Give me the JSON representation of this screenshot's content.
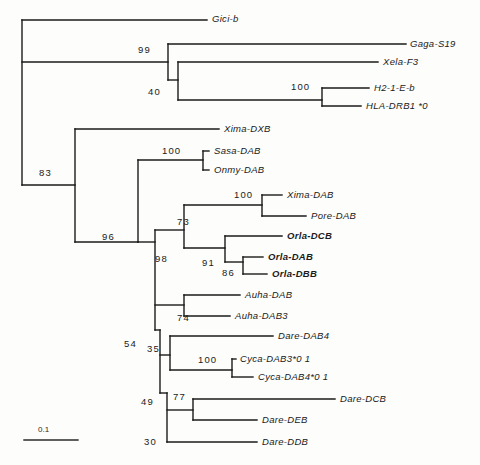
{
  "figure": {
    "type": "phylogenetic-tree",
    "background_color": "#fdfdfc",
    "line_color": "#1a1a1a",
    "text_color": "#1a1a1a"
  },
  "scale_bar": {
    "label": "0.1",
    "x1": 24,
    "x2": 78,
    "y": 440,
    "label_x": 38,
    "label_y": 425
  },
  "taxa": [
    {
      "id": "gici-b",
      "label": "Gici-b",
      "x": 212,
      "y": 14,
      "bold": false,
      "tip_x": 207,
      "tip_y": 20
    },
    {
      "id": "gaga-s19",
      "label": "Gaga-S19",
      "x": 410,
      "y": 39,
      "bold": false,
      "tip_x": 406,
      "tip_y": 44
    },
    {
      "id": "xela-f3",
      "label": "Xela-F3",
      "x": 383,
      "y": 57,
      "bold": false,
      "tip_x": 378,
      "tip_y": 62
    },
    {
      "id": "h2-1-e-b",
      "label": "H2-1-E-b",
      "x": 374,
      "y": 83,
      "bold": false,
      "tip_x": 369,
      "tip_y": 88
    },
    {
      "id": "hla-drb1-0",
      "label": "HLA-DRB1 *0",
      "x": 366,
      "y": 101,
      "bold": false,
      "tip_x": 361,
      "tip_y": 106
    },
    {
      "id": "xima-dxb",
      "label": "Xima-DXB",
      "x": 224,
      "y": 124,
      "bold": false,
      "tip_x": 219,
      "tip_y": 129
    },
    {
      "id": "sasa-dab",
      "label": "Sasa-DAB",
      "x": 214,
      "y": 146,
      "bold": false,
      "tip_x": 209,
      "tip_y": 151
    },
    {
      "id": "onmy-dab",
      "label": "Onmy-DAB",
      "x": 214,
      "y": 165,
      "bold": false,
      "tip_x": 209,
      "tip_y": 170
    },
    {
      "id": "xima-dab",
      "label": "Xima-DAB",
      "x": 287,
      "y": 190,
      "bold": false,
      "tip_x": 282,
      "tip_y": 195
    },
    {
      "id": "pore-dab",
      "label": "Pore-DAB",
      "x": 311,
      "y": 211,
      "bold": false,
      "tip_x": 306,
      "tip_y": 216
    },
    {
      "id": "orla-dcb",
      "label": "Orla-DCB",
      "x": 287,
      "y": 231,
      "bold": true,
      "tip_x": 282,
      "tip_y": 236
    },
    {
      "id": "orla-dab",
      "label": "Orla-DAB",
      "x": 268,
      "y": 252,
      "bold": true,
      "tip_x": 263,
      "tip_y": 257
    },
    {
      "id": "orla-dbb",
      "label": "Orla-DBB",
      "x": 272,
      "y": 269,
      "bold": true,
      "tip_x": 267,
      "tip_y": 274
    },
    {
      "id": "auha-dab",
      "label": "Auha-DAB",
      "x": 245,
      "y": 290,
      "bold": false,
      "tip_x": 240,
      "tip_y": 295
    },
    {
      "id": "auha-dab3",
      "label": "Auha-DAB3",
      "x": 235,
      "y": 311,
      "bold": false,
      "tip_x": 230,
      "tip_y": 316
    },
    {
      "id": "dare-dab4",
      "label": "Dare-DAB4",
      "x": 278,
      "y": 331,
      "bold": false,
      "tip_x": 273,
      "tip_y": 336
    },
    {
      "id": "cyca-dab3-01",
      "label": "Cyca-DAB3*0 1",
      "x": 240,
      "y": 354,
      "bold": false,
      "tip_x": 236,
      "tip_y": 359
    },
    {
      "id": "cyca-dab4-01",
      "label": "Cyca-DAB4*0 1",
      "x": 258,
      "y": 372,
      "bold": false,
      "tip_x": 253,
      "tip_y": 377
    },
    {
      "id": "dare-dcb",
      "label": "Dare-DCB",
      "x": 340,
      "y": 394,
      "bold": false,
      "tip_x": 335,
      "tip_y": 399
    },
    {
      "id": "dare-deb",
      "label": "Dare-DEB",
      "x": 262,
      "y": 415,
      "bold": false,
      "tip_x": 257,
      "tip_y": 420
    },
    {
      "id": "dare-ddb",
      "label": "Dare-DDB",
      "x": 262,
      "y": 437,
      "bold": false,
      "tip_x": 257,
      "tip_y": 442
    }
  ],
  "support_values": [
    {
      "id": "node-99",
      "label": "99",
      "x": 138,
      "y": 45
    },
    {
      "id": "node-40",
      "label": "40",
      "x": 148,
      "y": 87
    },
    {
      "id": "node-100a",
      "label": "100",
      "x": 291,
      "y": 82
    },
    {
      "id": "node-83",
      "label": "83",
      "x": 39,
      "y": 168
    },
    {
      "id": "node-100b",
      "label": "100",
      "x": 162,
      "y": 146
    },
    {
      "id": "node-100c",
      "label": "100",
      "x": 234,
      "y": 190
    },
    {
      "id": "node-73",
      "label": "73",
      "x": 177,
      "y": 217
    },
    {
      "id": "node-96",
      "label": "96",
      "x": 102,
      "y": 232
    },
    {
      "id": "node-98",
      "label": "98",
      "x": 155,
      "y": 254
    },
    {
      "id": "node-91",
      "label": "91",
      "x": 202,
      "y": 258
    },
    {
      "id": "node-86",
      "label": "86",
      "x": 222,
      "y": 268
    },
    {
      "id": "node-74",
      "label": "74",
      "x": 177,
      "y": 313
    },
    {
      "id": "node-54",
      "label": "54",
      "x": 124,
      "y": 339
    },
    {
      "id": "node-35",
      "label": "35",
      "x": 147,
      "y": 344
    },
    {
      "id": "node-100d",
      "label": "100",
      "x": 198,
      "y": 355
    },
    {
      "id": "node-49",
      "label": "49",
      "x": 141,
      "y": 397
    },
    {
      "id": "node-77",
      "label": "77",
      "x": 173,
      "y": 392
    },
    {
      "id": "node-30",
      "label": "30",
      "x": 144,
      "y": 437
    }
  ],
  "branches": [
    {
      "id": "root-vertical",
      "x1": 22,
      "y1": 20,
      "x2": 22,
      "y2": 185
    },
    {
      "id": "branch-gici-b",
      "x1": 22,
      "y1": 20,
      "x2": 207,
      "y2": 20
    },
    {
      "id": "branch-to-node99",
      "x1": 22,
      "y1": 62,
      "x2": 168,
      "y2": 62
    },
    {
      "id": "node99-vertical",
      "x1": 168,
      "y1": 44,
      "x2": 168,
      "y2": 80
    },
    {
      "id": "branch-gaga-s19",
      "x1": 168,
      "y1": 44,
      "x2": 406,
      "y2": 44
    },
    {
      "id": "node40-connector",
      "x1": 168,
      "y1": 80,
      "x2": 178,
      "y2": 80
    },
    {
      "id": "node40-vertical",
      "x1": 178,
      "y1": 62,
      "x2": 178,
      "y2": 100
    },
    {
      "id": "branch-xela-f3",
      "x1": 178,
      "y1": 62,
      "x2": 378,
      "y2": 62
    },
    {
      "id": "branch-to-node100a",
      "x1": 178,
      "y1": 100,
      "x2": 322,
      "y2": 100
    },
    {
      "id": "node100a-vertical",
      "x1": 322,
      "y1": 88,
      "x2": 322,
      "y2": 106
    },
    {
      "id": "branch-h2-1-e-b",
      "x1": 322,
      "y1": 88,
      "x2": 369,
      "y2": 88
    },
    {
      "id": "branch-hla-drb1",
      "x1": 322,
      "y1": 106,
      "x2": 361,
      "y2": 106
    },
    {
      "id": "branch-to-node83",
      "x1": 22,
      "y1": 185,
      "x2": 75,
      "y2": 185
    },
    {
      "id": "node83-vertical",
      "x1": 75,
      "y1": 129,
      "x2": 75,
      "y2": 242
    },
    {
      "id": "branch-xima-dxb",
      "x1": 75,
      "y1": 129,
      "x2": 219,
      "y2": 129
    },
    {
      "id": "branch-to-node96",
      "x1": 75,
      "y1": 242,
      "x2": 138,
      "y2": 242
    },
    {
      "id": "node96-vertical",
      "x1": 138,
      "y1": 160,
      "x2": 138,
      "y2": 242
    },
    {
      "id": "branch-to-node100b",
      "x1": 138,
      "y1": 160,
      "x2": 203,
      "y2": 160
    },
    {
      "id": "node100b-vertical",
      "x1": 203,
      "y1": 151,
      "x2": 203,
      "y2": 170
    },
    {
      "id": "branch-sasa-dab",
      "x1": 203,
      "y1": 151,
      "x2": 209,
      "y2": 151
    },
    {
      "id": "branch-onmy-dab",
      "x1": 203,
      "y1": 170,
      "x2": 209,
      "y2": 170
    },
    {
      "id": "branch-to-node98",
      "x1": 138,
      "y1": 242,
      "x2": 155,
      "y2": 242
    },
    {
      "id": "node98-vertical",
      "x1": 155,
      "y1": 230,
      "x2": 155,
      "y2": 330
    },
    {
      "id": "branch-to-node73",
      "x1": 155,
      "y1": 230,
      "x2": 184,
      "y2": 230
    },
    {
      "id": "node73-vertical",
      "x1": 184,
      "y1": 205,
      "x2": 184,
      "y2": 248
    },
    {
      "id": "branch-to-node100c",
      "x1": 184,
      "y1": 205,
      "x2": 262,
      "y2": 205
    },
    {
      "id": "node100c-vertical",
      "x1": 262,
      "y1": 195,
      "x2": 262,
      "y2": 216
    },
    {
      "id": "branch-xima-dab",
      "x1": 262,
      "y1": 195,
      "x2": 282,
      "y2": 195
    },
    {
      "id": "branch-pore-dab",
      "x1": 262,
      "y1": 216,
      "x2": 306,
      "y2": 216
    },
    {
      "id": "branch-to-node91",
      "x1": 184,
      "y1": 248,
      "x2": 225,
      "y2": 248
    },
    {
      "id": "node91-vertical",
      "x1": 225,
      "y1": 236,
      "x2": 225,
      "y2": 262
    },
    {
      "id": "branch-orla-dcb",
      "x1": 225,
      "y1": 236,
      "x2": 282,
      "y2": 236
    },
    {
      "id": "branch-to-node86",
      "x1": 225,
      "y1": 262,
      "x2": 243,
      "y2": 262
    },
    {
      "id": "node86-vertical",
      "x1": 243,
      "y1": 257,
      "x2": 243,
      "y2": 274
    },
    {
      "id": "branch-orla-dab",
      "x1": 243,
      "y1": 257,
      "x2": 263,
      "y2": 257
    },
    {
      "id": "branch-orla-dbb",
      "x1": 243,
      "y1": 274,
      "x2": 267,
      "y2": 274
    },
    {
      "id": "branch-to-node74",
      "x1": 155,
      "y1": 305,
      "x2": 184,
      "y2": 305
    },
    {
      "id": "node74-vertical",
      "x1": 184,
      "y1": 295,
      "x2": 184,
      "y2": 316
    },
    {
      "id": "branch-auha-dab",
      "x1": 184,
      "y1": 295,
      "x2": 240,
      "y2": 295
    },
    {
      "id": "branch-auha-dab3",
      "x1": 184,
      "y1": 316,
      "x2": 230,
      "y2": 316
    },
    {
      "id": "branch-to-node54",
      "x1": 155,
      "y1": 330,
      "x2": 160,
      "y2": 330
    },
    {
      "id": "node54-vertical",
      "x1": 160,
      "y1": 330,
      "x2": 160,
      "y2": 393
    },
    {
      "id": "branch-to-node35",
      "x1": 160,
      "y1": 355,
      "x2": 170,
      "y2": 355
    },
    {
      "id": "node35-vertical",
      "x1": 170,
      "y1": 336,
      "x2": 170,
      "y2": 370
    },
    {
      "id": "branch-dare-dab4",
      "x1": 170,
      "y1": 336,
      "x2": 273,
      "y2": 336
    },
    {
      "id": "branch-to-node100d",
      "x1": 170,
      "y1": 370,
      "x2": 232,
      "y2": 370
    },
    {
      "id": "node100d-vertical",
      "x1": 232,
      "y1": 359,
      "x2": 232,
      "y2": 377
    },
    {
      "id": "branch-cyca-dab3",
      "x1": 232,
      "y1": 359,
      "x2": 236,
      "y2": 359
    },
    {
      "id": "branch-cyca-dab4",
      "x1": 232,
      "y1": 377,
      "x2": 253,
      "y2": 377
    },
    {
      "id": "branch-to-node49",
      "x1": 160,
      "y1": 393,
      "x2": 167,
      "y2": 393
    },
    {
      "id": "node49-vertical",
      "x1": 167,
      "y1": 393,
      "x2": 167,
      "y2": 442
    },
    {
      "id": "branch-to-node77",
      "x1": 167,
      "y1": 410,
      "x2": 193,
      "y2": 410
    },
    {
      "id": "node77-vertical",
      "x1": 193,
      "y1": 399,
      "x2": 193,
      "y2": 420
    },
    {
      "id": "branch-dare-dcb",
      "x1": 193,
      "y1": 399,
      "x2": 335,
      "y2": 399
    },
    {
      "id": "branch-dare-deb",
      "x1": 193,
      "y1": 420,
      "x2": 257,
      "y2": 420
    },
    {
      "id": "branch-dare-ddb",
      "x1": 167,
      "y1": 442,
      "x2": 257,
      "y2": 442
    }
  ]
}
